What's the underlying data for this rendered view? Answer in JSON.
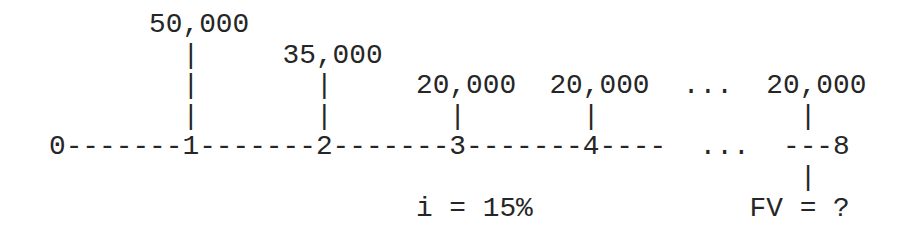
{
  "diagram": {
    "type": "cash-flow-timeline",
    "rows": [
      "      50,000",
      "        |     35,000",
      "        |       |     20,000  20,000  ...  20,000",
      "        |       |       |       |            |",
      "0-------1-------2-------3-------4----  ...  ---8",
      "                                             |",
      "                      i = 15%             FV = ?"
    ],
    "periods": [
      "0",
      "1",
      "2",
      "3",
      "4",
      "...",
      "8"
    ],
    "cash_flows": [
      {
        "period": "1",
        "amount": "50,000"
      },
      {
        "period": "2",
        "amount": "35,000"
      },
      {
        "period": "3",
        "amount": "20,000"
      },
      {
        "period": "4",
        "amount": "20,000"
      },
      {
        "period": "...",
        "amount": "..."
      },
      {
        "period": "8",
        "amount": "20,000"
      }
    ],
    "interest_rate_label": "i = 15%",
    "future_value_label": "FV = ?"
  }
}
